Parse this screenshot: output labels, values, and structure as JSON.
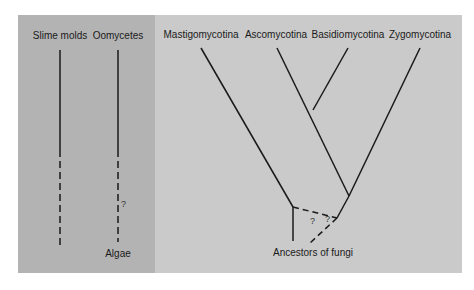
{
  "left_panel": {
    "taxa": [
      {
        "label": "Slime molds"
      },
      {
        "label": "Oomycetes"
      }
    ],
    "uncertain_mark": "?",
    "origin_label": "Algae"
  },
  "right_panel": {
    "taxa": [
      {
        "label": "Mastigomycotina"
      },
      {
        "label": "Ascomycotina"
      },
      {
        "label": "Basidiomycotina"
      },
      {
        "label": "Zygomycotina"
      }
    ],
    "uncertain_marks": [
      "?",
      "?"
    ],
    "root_label": "Ancestors of fungi"
  },
  "colors": {
    "left_bg": "#b3b3b3",
    "right_bg": "#cacaca",
    "line": "#1a1a1a"
  }
}
